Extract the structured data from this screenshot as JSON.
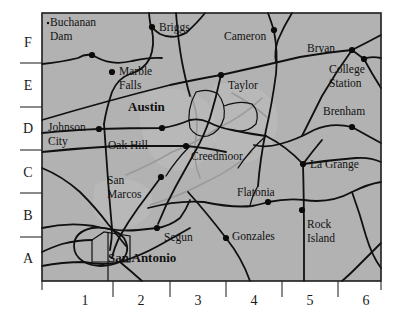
{
  "figure": {
    "name": "central-texas-reference-map",
    "style": "grayscale printed atlas map with alphanumeric grid reference border"
  },
  "colors": {
    "land_fill": "#b2b2b2",
    "frame_stroke": "#1c1c1c",
    "road_stroke": "#101010",
    "river_stroke": "#9a9a9a",
    "label_text": "#111111",
    "page_background": "#ffffff"
  },
  "grid": {
    "row_labels": [
      "F",
      "E",
      "D",
      "C",
      "B",
      "A"
    ],
    "column_labels": [
      "1",
      "2",
      "3",
      "4",
      "5",
      "6"
    ],
    "row_label_positions_y": [
      42,
      85,
      128,
      172,
      215,
      258
    ],
    "column_label_positions_x": [
      85,
      141,
      198,
      254,
      310,
      366
    ],
    "row_tick_positions_y": [
      63,
      107,
      150,
      193,
      237
    ],
    "column_tick_positions_x": [
      113,
      170,
      226,
      282,
      338
    ],
    "frame": {
      "x": 42,
      "y": 13,
      "width": 339,
      "height": 268
    }
  },
  "cities": [
    {
      "name": "Buchanan Dam",
      "label_lines": [
        "Buchanan",
        "Dam"
      ],
      "dot_x": 92,
      "dot_y": 55,
      "label_x": 50,
      "label_y": 26,
      "align": "start",
      "major": false,
      "grid_ref": "F1"
    },
    {
      "name": "Briggs",
      "label_lines": [
        "Briggs"
      ],
      "dot_x": 152,
      "dot_y": 27,
      "label_x": 159,
      "label_y": 31,
      "align": "start",
      "major": false,
      "grid_ref": "F2"
    },
    {
      "name": "Cameron",
      "label_lines": [
        "Cameron"
      ],
      "dot_x": 274,
      "dot_y": 30,
      "label_x": 224,
      "label_y": 40,
      "align": "start",
      "major": false,
      "grid_ref": "F4"
    },
    {
      "name": "Bryan",
      "label_lines": [
        "Bryan"
      ],
      "dot_x": 352,
      "dot_y": 50,
      "label_x": 307,
      "label_y": 52,
      "align": "start",
      "major": false,
      "grid_ref": "F5"
    },
    {
      "name": "College Station",
      "label_lines": [
        "College",
        "Station"
      ],
      "dot_x": 364,
      "dot_y": 59,
      "label_x": 329,
      "label_y": 73,
      "align": "start",
      "major": false,
      "grid_ref": "E6"
    },
    {
      "name": "Marble Falls",
      "label_lines": [
        "Marble",
        "Falls"
      ],
      "dot_x": 112,
      "dot_y": 72,
      "label_x": 119,
      "label_y": 75,
      "align": "start",
      "major": false,
      "grid_ref": "E2"
    },
    {
      "name": "Taylor",
      "label_lines": [
        "Taylor"
      ],
      "dot_x": 221,
      "dot_y": 75,
      "label_x": 228,
      "label_y": 89,
      "align": "start",
      "major": false,
      "grid_ref": "E4"
    },
    {
      "name": "Austin",
      "label_lines": [
        "Austin"
      ],
      "dot_x": 0,
      "dot_y": 0,
      "label_x": 128,
      "label_y": 111,
      "align": "start",
      "major": true,
      "grid_ref": "D3"
    },
    {
      "name": "Brenham",
      "label_lines": [
        "Brenham"
      ],
      "dot_x": 352,
      "dot_y": 127,
      "label_x": 323,
      "label_y": 115,
      "align": "start",
      "major": false,
      "grid_ref": "D6"
    },
    {
      "name": "Johnson City",
      "label_lines": [
        "Johnson",
        "City"
      ],
      "dot_x": 99,
      "dot_y": 129,
      "label_x": 48,
      "label_y": 131,
      "align": "start",
      "major": false,
      "grid_ref": "D1"
    },
    {
      "name": "Oak Hill",
      "label_lines": [
        "Oak Hill"
      ],
      "dot_x": 162,
      "dot_y": 128,
      "label_x": 108,
      "label_y": 149,
      "align": "start",
      "major": false,
      "grid_ref": "C2"
    },
    {
      "name": "Creedmoor",
      "label_lines": [
        "Creedmoor"
      ],
      "dot_x": 186,
      "dot_y": 146,
      "label_x": 191,
      "label_y": 160,
      "align": "start",
      "major": false,
      "grid_ref": "C3"
    },
    {
      "name": "La Grange",
      "label_lines": [
        "La Grange"
      ],
      "dot_x": 303,
      "dot_y": 164,
      "label_x": 310,
      "label_y": 168,
      "align": "start",
      "major": false,
      "grid_ref": "C5"
    },
    {
      "name": "San Marcos",
      "label_lines": [
        "San",
        "Marcos"
      ],
      "dot_x": 161,
      "dot_y": 177,
      "label_x": 107,
      "label_y": 184,
      "align": "start",
      "major": false,
      "grid_ref": "B2"
    },
    {
      "name": "Flatonia",
      "label_lines": [
        "Flatonia"
      ],
      "dot_x": 268,
      "dot_y": 202,
      "label_x": 237,
      "label_y": 196,
      "align": "start",
      "major": false,
      "grid_ref": "B4"
    },
    {
      "name": "Rock Island",
      "label_lines": [
        "Rock",
        "Island"
      ],
      "dot_x": 302,
      "dot_y": 210,
      "label_x": 307,
      "label_y": 228,
      "align": "start",
      "major": false,
      "grid_ref": "B5"
    },
    {
      "name": "Segun",
      "label_lines": [
        "Segun"
      ],
      "dot_x": 157,
      "dot_y": 228,
      "label_x": 164,
      "label_y": 241,
      "align": "start",
      "major": false,
      "grid_ref": "A2"
    },
    {
      "name": "Gonzales",
      "label_lines": [
        "Gonzales"
      ],
      "dot_x": 226,
      "dot_y": 238,
      "label_x": 232,
      "label_y": 240,
      "align": "start",
      "major": false,
      "grid_ref": "A4"
    },
    {
      "name": "San Antonio",
      "label_lines": [
        "San Antonio"
      ],
      "dot_x": 0,
      "dot_y": 0,
      "label_x": 108,
      "label_y": 262,
      "align": "start",
      "major": true,
      "grid_ref": "A1"
    }
  ]
}
